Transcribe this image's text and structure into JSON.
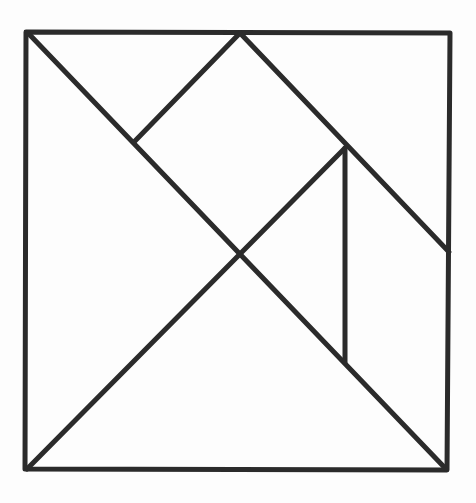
{
  "diagram": {
    "type": "tangram",
    "stroke_color": "#2b2b2b",
    "stroke_width": 5,
    "background_color": "#fdfdfd",
    "outer_square": {
      "top_left": [
        26,
        32
      ],
      "top_right": [
        450,
        33
      ],
      "bottom_right": [
        447,
        470
      ],
      "bottom_left": [
        25,
        469
      ]
    },
    "points": {
      "TL": [
        28,
        33
      ],
      "TM": [
        240,
        33
      ],
      "TR": [
        450,
        33
      ],
      "BL": [
        27,
        469
      ],
      "BR": [
        446,
        469
      ],
      "C": [
        240,
        253
      ],
      "SQ_L": [
        134,
        142
      ],
      "R1": [
        345,
        148
      ],
      "R2": [
        449,
        252
      ],
      "V_BOT": [
        345,
        362
      ]
    },
    "lines": [
      {
        "name": "diagonal-tl-br",
        "from": "TL",
        "to": "BR"
      },
      {
        "name": "diagonal-bl-r1",
        "from": "BL",
        "to": "R1"
      },
      {
        "name": "top-mid-to-square-left",
        "from": "TM",
        "to": "SQ_L"
      },
      {
        "name": "top-mid-to-right-edge",
        "from": "TM",
        "to": "R2"
      },
      {
        "name": "vertical-divider",
        "from": "R1",
        "to": "V_BOT"
      }
    ],
    "pieces": [
      {
        "name": "large-triangle-left",
        "vertices": [
          "TL",
          "C",
          "BL"
        ]
      },
      {
        "name": "large-triangle-bottom",
        "vertices": [
          "BL",
          "C",
          "BR"
        ]
      },
      {
        "name": "small-triangle-top-left",
        "vertices": [
          "TL",
          "TM",
          "SQ_L"
        ]
      },
      {
        "name": "square",
        "vertices": [
          "TM",
          "R1",
          "C",
          "SQ_L"
        ]
      },
      {
        "name": "small-triangle-middle-right",
        "vertices": [
          "R1",
          "V_BOT",
          "C"
        ]
      },
      {
        "name": "medium-triangle-top-right",
        "vertices": [
          "TM",
          "TR",
          "R2"
        ]
      },
      {
        "name": "parallelogram-right",
        "vertices": [
          "R1",
          "R2",
          "BR",
          "V_BOT"
        ]
      }
    ]
  }
}
